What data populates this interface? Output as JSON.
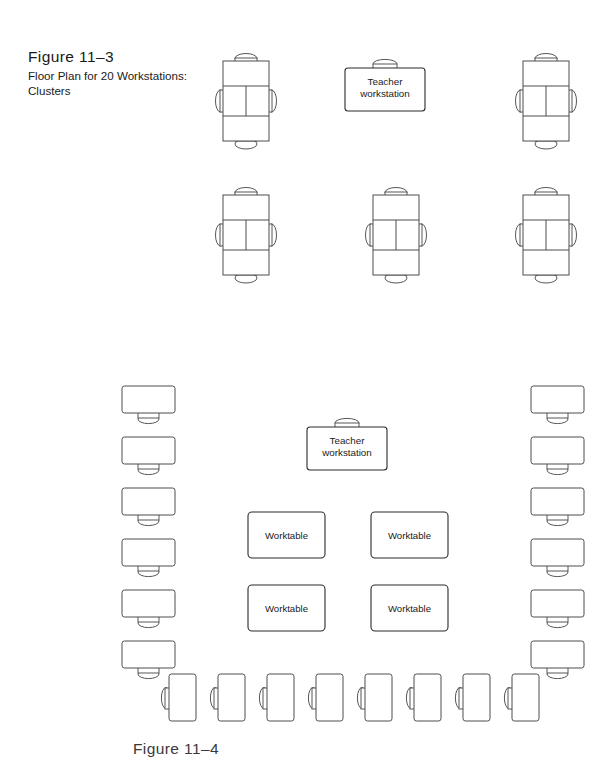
{
  "figure": {
    "number": "Figure 11–3",
    "title_line1": "Floor Plan for 20 Workstations:",
    "title_line2": "Clusters",
    "next_figure_number": "Figure 11–4"
  },
  "labels": {
    "teacher_line1": "Teacher",
    "teacher_line2": "workstation",
    "worktable": "Worktable"
  },
  "colors": {
    "stroke": "#4d4d4d",
    "stroke_dark": "#2b2b2b",
    "fill": "#ffffff",
    "text": "#1a1a1a"
  },
  "diagram_data": {
    "type": "floor-plan",
    "figures": [
      {
        "id": "clusters-plan",
        "caption": "Figure 11–3 Floor Plan for 20 Workstations: Clusters",
        "rows": [
          {
            "row": 1,
            "y": 52,
            "items": [
              {
                "kind": "cluster",
                "x": 218,
                "seats": 4
              },
              {
                "kind": "teacher-workstation",
                "x": 345
              },
              {
                "kind": "cluster",
                "x": 518,
                "seats": 4
              }
            ]
          },
          {
            "row": 2,
            "y": 186,
            "items": [
              {
                "kind": "cluster",
                "x": 218,
                "seats": 4
              },
              {
                "kind": "cluster",
                "x": 368,
                "seats": 4
              },
              {
                "kind": "cluster",
                "x": 518,
                "seats": 4
              }
            ]
          }
        ],
        "cluster_count": 5,
        "workstations_per_cluster": 4,
        "total_workstations": 20,
        "teacher_workstations": 1
      },
      {
        "id": "worktables-plan",
        "caption": "Figure 11–4",
        "left_column_desks": {
          "count": 6,
          "x": 122,
          "y_start": 386,
          "y_step": 51
        },
        "right_column_desks": {
          "count": 6,
          "x": 531,
          "y_start": 386,
          "y_step": 51
        },
        "teacher_workstation": {
          "x": 307,
          "y": 427
        },
        "worktables": [
          {
            "x": 248,
            "y": 512
          },
          {
            "x": 371,
            "y": 512
          },
          {
            "x": 248,
            "y": 585
          },
          {
            "x": 371,
            "y": 585
          }
        ],
        "bottom_row_desks": {
          "count": 8,
          "x_start": 168,
          "x_step": 49,
          "y": 674
        }
      }
    ]
  }
}
